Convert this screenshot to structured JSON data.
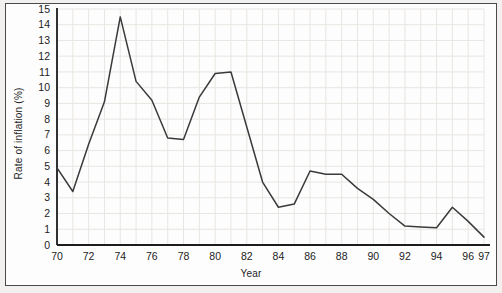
{
  "chart_data": {
    "type": "line",
    "title": "",
    "xlabel": "Year",
    "ylabel": "Rate of inflation (%)",
    "xlim": [
      70,
      97
    ],
    "ylim": [
      0,
      15
    ],
    "grid": true,
    "legend": "none",
    "x_tick_labels": [
      "70",
      "72",
      "74",
      "76",
      "78",
      "80",
      "82",
      "84",
      "86",
      "88",
      "90",
      "92",
      "94",
      "96",
      "97"
    ],
    "x_tick_values": [
      70,
      72,
      74,
      76,
      78,
      80,
      82,
      84,
      86,
      88,
      90,
      92,
      94,
      96,
      97
    ],
    "y_tick_labels": [
      "0",
      "1",
      "2",
      "3",
      "4",
      "5",
      "6",
      "7",
      "8",
      "9",
      "10",
      "11",
      "12",
      "13",
      "14",
      "15"
    ],
    "y_tick_values": [
      0,
      1,
      2,
      3,
      4,
      5,
      6,
      7,
      8,
      9,
      10,
      11,
      12,
      13,
      14,
      15
    ],
    "x": [
      70,
      71,
      72,
      73,
      74,
      75,
      76,
      77,
      78,
      79,
      80,
      81,
      82,
      83,
      84,
      85,
      86,
      87,
      88,
      89,
      90,
      91,
      92,
      93,
      94,
      95,
      96,
      97
    ],
    "values": [
      4.9,
      3.4,
      6.4,
      9.1,
      14.5,
      10.4,
      9.2,
      6.8,
      6.7,
      9.4,
      10.9,
      11.0,
      7.5,
      4.0,
      2.4,
      2.6,
      4.7,
      4.5,
      4.5,
      3.6,
      2.9,
      2.0,
      1.2,
      1.15,
      1.1,
      2.4,
      1.5,
      0.5
    ],
    "series_name": "Rate of inflation",
    "line_color": "#3a3a3a",
    "grid_color": "#e8e6e2",
    "axis_color": "#1c1c1c",
    "background_color": "#f2f1ef",
    "plot_background_color": "#fdfdfd"
  }
}
